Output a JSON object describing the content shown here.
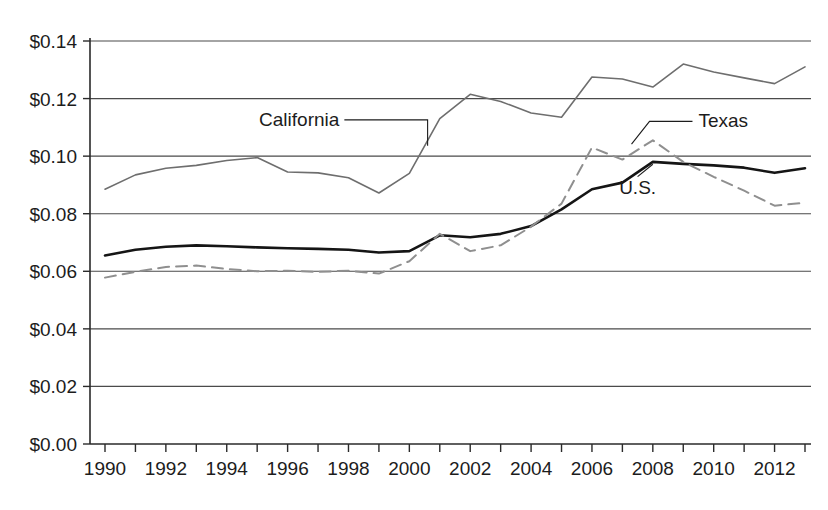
{
  "chart_data": {
    "type": "line",
    "title": "",
    "subtitle": "",
    "xlabel": "",
    "ylabel": "",
    "xlim": [
      1990,
      2013
    ],
    "ylim": [
      0.0,
      0.14
    ],
    "grid": true,
    "grid_axis": "y",
    "legend_position": "inline-annotations",
    "y_ticks": [
      0.0,
      0.02,
      0.04,
      0.06,
      0.08,
      0.1,
      0.12,
      0.14
    ],
    "y_tick_labels": [
      "$0.00",
      "$0.02",
      "$0.04",
      "$0.06",
      "$0.08",
      "$0.10",
      "$0.12",
      "$0.14"
    ],
    "x_ticks": [
      1990,
      1991,
      1992,
      1993,
      1994,
      1995,
      1996,
      1997,
      1998,
      1999,
      2000,
      2001,
      2002,
      2003,
      2004,
      2005,
      2006,
      2007,
      2008,
      2009,
      2010,
      2011,
      2012,
      2013
    ],
    "x_tick_labels_shown": [
      "1990",
      "1992",
      "1994",
      "1996",
      "1998",
      "2000",
      "2002",
      "2004",
      "2006",
      "2008",
      "2010",
      "2012"
    ],
    "x": [
      1990,
      1991,
      1992,
      1993,
      1994,
      1995,
      1996,
      1997,
      1998,
      1999,
      2000,
      2001,
      2002,
      2003,
      2004,
      2005,
      2006,
      2007,
      2008,
      2009,
      2010,
      2011,
      2012,
      2013
    ],
    "series": [
      {
        "name": "California",
        "style": "solid",
        "color": "#6e6e6e",
        "width": 1.6,
        "values": [
          0.0885,
          0.0935,
          0.0958,
          0.0968,
          0.0985,
          0.0995,
          0.0945,
          0.0942,
          0.0925,
          0.0872,
          0.094,
          0.113,
          0.1215,
          0.119,
          0.115,
          0.1135,
          0.1275,
          0.1268,
          0.124,
          0.132,
          0.1292,
          0.1272,
          0.1252,
          0.131
        ]
      },
      {
        "name": "U.S.",
        "style": "solid",
        "color": "#151515",
        "width": 2.6,
        "values": [
          0.0655,
          0.0675,
          0.0685,
          0.069,
          0.0687,
          0.0683,
          0.068,
          0.0678,
          0.0675,
          0.0665,
          0.067,
          0.0725,
          0.0718,
          0.073,
          0.0757,
          0.0815,
          0.0885,
          0.0908,
          0.098,
          0.0973,
          0.0968,
          0.096,
          0.0942,
          0.0958
        ]
      },
      {
        "name": "Texas",
        "style": "dashed",
        "color": "#8f8f8f",
        "width": 2.0,
        "values": [
          0.0578,
          0.0598,
          0.0615,
          0.062,
          0.0608,
          0.06,
          0.0602,
          0.0598,
          0.0602,
          0.0592,
          0.0635,
          0.073,
          0.067,
          0.069,
          0.0755,
          0.0835,
          0.103,
          0.0988,
          0.1055,
          0.098,
          0.0928,
          0.088,
          0.0828,
          0.0838
        ]
      }
    ],
    "annotations": [
      {
        "text": "California",
        "series": "California",
        "anchor_x": 1997.7,
        "anchor_y": 0.1105,
        "target_x": 2000.6,
        "target_y": 0.1036
      },
      {
        "text": "Texas",
        "series": "Texas",
        "anchor_x": 2009.5,
        "anchor_y": 0.11,
        "target_x": 2007.3,
        "target_y": 0.1042
      },
      {
        "text": "U.S.",
        "series": "U.S.",
        "anchor_x": 2007.5,
        "anchor_y": 0.087,
        "target_x": 2008.0,
        "target_y": 0.0972
      }
    ]
  },
  "colors": {
    "background": "#ffffff",
    "grid": "#4a4a4a",
    "axis": "#2a2a2a",
    "text": "#1c1c1c",
    "california": "#6e6e6e",
    "us": "#151515",
    "texas": "#8f8f8f"
  }
}
